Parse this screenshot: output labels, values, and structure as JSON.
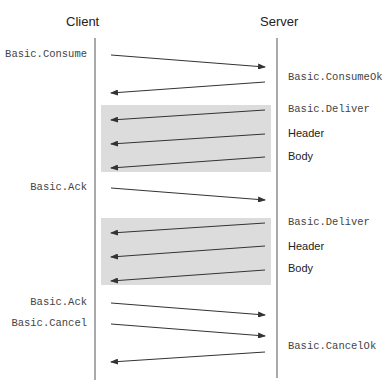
{
  "diagram": {
    "type": "sequence",
    "participants": [
      {
        "name": "Client",
        "x": 95
      },
      {
        "name": "Server",
        "x": 277
      }
    ],
    "colors": {
      "lifeline": "#555555",
      "arrow": "#333333",
      "highlight_box": "#dcdcdc"
    },
    "highlight_boxes": [
      {
        "x": 101,
        "y": 105,
        "w": 170,
        "h": 67
      },
      {
        "x": 101,
        "y": 218,
        "w": 170,
        "h": 67
      }
    ],
    "messages": [
      {
        "label": "Basic.Consume",
        "side": "client",
        "direction": "to-server",
        "style": "mono",
        "y1": 55,
        "y2": 67,
        "label_y": 55
      },
      {
        "label": "Basic.ConsumeOk",
        "side": "server",
        "direction": "to-client",
        "style": "mono",
        "y1": 82,
        "y2": 93,
        "label_y": 78
      },
      {
        "label": "Basic.Deliver",
        "side": "server",
        "direction": "to-client",
        "style": "mono",
        "y1": 110,
        "y2": 120,
        "label_y": 110
      },
      {
        "label": "Header",
        "side": "server",
        "direction": "to-client",
        "style": "sans",
        "y1": 134,
        "y2": 144,
        "label_y": 134
      },
      {
        "label": "Body",
        "side": "server",
        "direction": "to-client",
        "style": "sans",
        "y1": 157,
        "y2": 168,
        "label_y": 157
      },
      {
        "label": "Basic.Ack",
        "side": "client",
        "direction": "to-server",
        "style": "mono",
        "y1": 188,
        "y2": 200,
        "label_y": 188
      },
      {
        "label": "Basic.Deliver",
        "side": "server",
        "direction": "to-client",
        "style": "mono",
        "y1": 223,
        "y2": 233,
        "label_y": 223
      },
      {
        "label": "Header",
        "side": "server",
        "direction": "to-client",
        "style": "sans",
        "y1": 246,
        "y2": 257,
        "label_y": 247
      },
      {
        "label": "Body",
        "side": "server",
        "direction": "to-client",
        "style": "sans",
        "y1": 270,
        "y2": 281,
        "label_y": 269
      },
      {
        "label": "Basic.Ack",
        "side": "client",
        "direction": "to-server",
        "style": "mono",
        "y1": 303,
        "y2": 315,
        "label_y": 303
      },
      {
        "label": "Basic.Cancel",
        "side": "client",
        "direction": "to-server",
        "style": "mono",
        "y1": 324,
        "y2": 336,
        "label_y": 324
      },
      {
        "label": "Basic.CancelOk",
        "side": "server",
        "direction": "to-client",
        "style": "mono",
        "y1": 352,
        "y2": 362,
        "label_y": 347
      }
    ]
  }
}
